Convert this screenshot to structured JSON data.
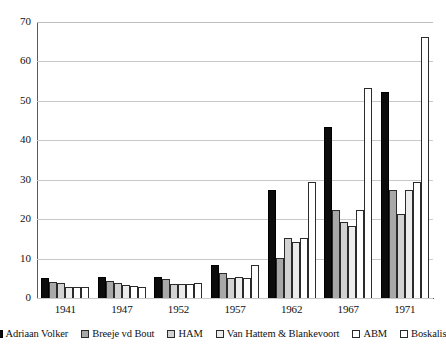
{
  "chart_data": {
    "type": "bar",
    "title": "",
    "subtitle": "",
    "xlabel": "",
    "ylabel": "",
    "ylim": [
      0,
      70
    ],
    "ytick_step": 10,
    "yticks": [
      0,
      10,
      20,
      30,
      40,
      50,
      60,
      70
    ],
    "grid": true,
    "legend_position": "bottom",
    "categories": [
      "1941",
      "1947",
      "1952",
      "1957",
      "1962",
      "1967",
      "1971"
    ],
    "series": [
      {
        "name": "Adriaan Volker",
        "color": "#0c0c0c",
        "values": [
          5.2,
          5.3,
          5.3,
          8.3,
          27.3,
          43.3,
          52.3
        ]
      },
      {
        "name": "Breeje vd Bout",
        "color": "#a8a8a8",
        "values": [
          4.1,
          4.2,
          4.8,
          6.3,
          10.2,
          22.3,
          27.3
        ]
      },
      {
        "name": "HAM",
        "color": "#d2d2d2",
        "values": [
          3.7,
          3.9,
          3.6,
          5.1,
          15.2,
          19.3,
          21.3
        ]
      },
      {
        "name": "Van Hattem & Blankevoort",
        "color": "#ececec",
        "values": [
          2.8,
          3.2,
          3.5,
          5.3,
          14.2,
          18.3,
          27.3
        ]
      },
      {
        "name": "ABM",
        "color": "#ffffff",
        "values": [
          2.8,
          3.1,
          3.5,
          5.0,
          15.3,
          22.3,
          29.4
        ]
      },
      {
        "name": "Boskalis",
        "color": "#ffffff",
        "values": [
          2.8,
          2.9,
          3.7,
          8.3,
          29.3,
          53.3,
          66.3
        ]
      }
    ]
  }
}
